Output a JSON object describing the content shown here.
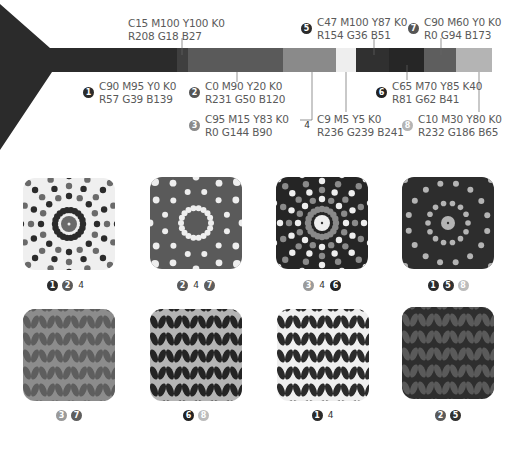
{
  "palette": {
    "swatches": [
      {
        "id": "1",
        "num": "1",
        "cmyk": "C90 M95 Y0 K0",
        "rgb": "R57 G39 B139",
        "hex": "#39278B",
        "gray": "#2e2e2e"
      },
      {
        "id": "2",
        "num": "2",
        "cmyk": "C0 M90 Y20 K0",
        "rgb": "R231 G50 B120",
        "hex": "#E73278",
        "gray": "#5a5a5a"
      },
      {
        "id": "3",
        "num": "3",
        "cmyk": "C95 M15 Y83 K0",
        "rgb": "R0 G144 B90",
        "hex": "#00905A",
        "gray": "#8a8a8a"
      },
      {
        "id": "4",
        "num": "4",
        "cmyk": "C9 M5 Y5 K0",
        "rgb": "R236 G239 B241",
        "hex": "#ECEFF1",
        "gray": "#eeeeee"
      },
      {
        "id": "5",
        "num": "5",
        "cmyk": "C47 M100 Y87 K0",
        "rgb": "R154 G36 B51",
        "hex": "#9A2433",
        "gray": "#303030"
      },
      {
        "id": "6",
        "num": "6",
        "cmyk": "C65 M70 Y85 K40",
        "rgb": "R81 G62 B41",
        "hex": "#513E29",
        "gray": "#262626"
      },
      {
        "id": "7",
        "num": "7",
        "cmyk": "C90 M60 Y0 K0",
        "rgb": "R0 G94 B173",
        "hex": "#005EAD",
        "gray": "#5e5e5e"
      },
      {
        "id": "8",
        "num": "8",
        "cmyk": "C10 M30 Y80 K0",
        "rgb": "R232 G186 B65",
        "hex": "#E8BA41",
        "gray": "#b4b4b4"
      },
      {
        "id": "red",
        "num": "",
        "cmyk": "C15 M100 Y100 K0",
        "rgb": "R208 G18 B27",
        "hex": "#D0121B",
        "gray": "#3f3f3f"
      }
    ]
  },
  "tiles": [
    {
      "name": "radial-dots-light",
      "labels": [
        "1",
        "2",
        "4"
      ]
    },
    {
      "name": "circle-dots-pink",
      "labels": [
        "2",
        "4",
        "7"
      ]
    },
    {
      "name": "radial-dots-brown",
      "labels": [
        "3",
        "4",
        "6"
      ]
    },
    {
      "name": "circle-dots-purple",
      "labels": [
        "1",
        "5",
        "8"
      ]
    },
    {
      "name": "leaf-green",
      "labels": [
        "3",
        "7"
      ]
    },
    {
      "name": "leaf-yellow",
      "labels": [
        "6",
        "8"
      ]
    },
    {
      "name": "leaf-white",
      "labels": [
        "1",
        "4"
      ]
    },
    {
      "name": "leaf-burgundy",
      "labels": [
        "2",
        "5"
      ]
    }
  ]
}
